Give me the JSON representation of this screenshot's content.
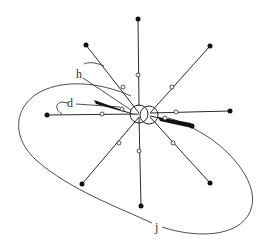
{
  "figure": {
    "type": "radial line diagram with central double circle, spokes and enclosing loop",
    "labels": {
      "h": "h",
      "d": "d",
      "j": "j"
    },
    "colors": {
      "stroke": "#2a2a2a",
      "background": "#ffffff"
    },
    "hub": {
      "left_circle": {
        "cx": 139,
        "cy": 114,
        "r": 9
      },
      "right_circle": {
        "cx": 149,
        "cy": 115,
        "r": 9
      }
    },
    "spokes": [
      {
        "name": "top",
        "end": [
          138,
          19
        ],
        "mid": [
          138,
          75
        ]
      },
      {
        "name": "upper-left",
        "end": [
          86,
          45
        ],
        "mid": [
          123,
          87
        ]
      },
      {
        "name": "upper-right",
        "end": [
          210,
          46
        ],
        "mid": [
          172,
          87
        ]
      },
      {
        "name": "left",
        "end": [
          47,
          115
        ],
        "mid": [
          102,
          114
        ]
      },
      {
        "name": "right",
        "end": [
          230,
          111
        ],
        "mid": [
          176,
          112
        ]
      },
      {
        "name": "lower-left",
        "end": [
          82,
          184
        ],
        "mid": [
          119,
          143
        ]
      },
      {
        "name": "bottom",
        "end": [
          141,
          206
        ],
        "mid": [
          139,
          151
        ]
      },
      {
        "name": "lower-right",
        "end": [
          210,
          183
        ],
        "mid": [
          173,
          143
        ]
      },
      {
        "name": "right-short",
        "end": [
          192,
          125
        ],
        "mid": [
          165,
          118
        ]
      }
    ]
  }
}
